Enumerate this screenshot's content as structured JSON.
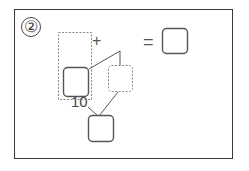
{
  "problem": {
    "number_label": "②",
    "plus_sign": "+",
    "equals_sign": "=",
    "given_number": "10"
  },
  "colors": {
    "frame": "#3a3a3a",
    "solid_box": "#555555",
    "dashed_box": "#888888",
    "line": "#555555"
  },
  "boxes": [
    {
      "name": "addend-box",
      "style": "solid"
    },
    {
      "name": "addend-group-dashed",
      "style": "dashed"
    },
    {
      "name": "split-part-dashed",
      "style": "dashed"
    },
    {
      "name": "answer-box",
      "style": "solid"
    },
    {
      "name": "decomposition-result-box",
      "style": "solid"
    }
  ]
}
